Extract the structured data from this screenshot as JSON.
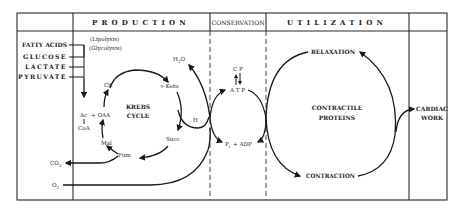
{
  "header": {
    "sections": [
      {
        "id": "production",
        "label": "PRODUCTION"
      },
      {
        "id": "conservation",
        "label": "CONSERVATION"
      },
      {
        "id": "utilization",
        "label": "UTILIZATION"
      }
    ]
  },
  "substrates": {
    "items": [
      "FATTY ACIDS",
      "GLUCOSE",
      "LACTATE",
      "PYRUVATE"
    ],
    "notes": [
      "(Lipolysis)",
      "(Glycolysis)"
    ]
  },
  "krebs": {
    "title_line1": "KREBS",
    "title_line2": "CYCLE",
    "acetyl": "Ac",
    "plus_oaa": "+ OAA",
    "coa": "CoA",
    "cit": "Cit",
    "keto": "∝-Keto",
    "succ": "Succ",
    "fum": "Fum",
    "mal": "Mal",
    "h": "H"
  },
  "gases": {
    "co2": "CO",
    "co2_sub": "2",
    "o2": "O",
    "o2_sub": "2",
    "h2o_h": "H",
    "h2o_sub": "2",
    "h2o_o": "O"
  },
  "conservation": {
    "cp": "C P",
    "atp": "A T P",
    "pi": "P",
    "pi_sub": "i",
    "adp": "+ ADP"
  },
  "utilization": {
    "relaxation": "RELAXATION",
    "contraction": "CONTRACTION",
    "proteins_line1": "CONTRACTILE",
    "proteins_line2": "PROTEINS",
    "cardiac_line1": "CARDIAC",
    "cardiac_line2": "WORK"
  },
  "colors": {
    "ink": "#1a1a1a",
    "paper": "#ffffff"
  }
}
